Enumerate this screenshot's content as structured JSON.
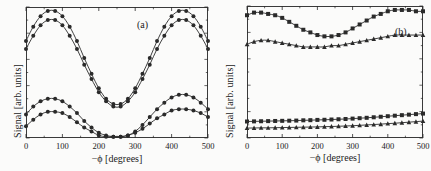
{
  "figure": {
    "background": "#fbfbfa",
    "ink": "#2a2a2a"
  },
  "panels": [
    {
      "tag": "(a)",
      "xlabel": "−ϕ [degrees]",
      "ylabel": "Signal [arb. units]",
      "xticks": [
        "0",
        "100",
        "200",
        "300",
        "400",
        "500"
      ]
    },
    {
      "tag": "(b)",
      "xlabel": "−ϕ [degrees]",
      "ylabel": "Signal [arb. units]",
      "xticks": [
        "0",
        "100",
        "200",
        "300",
        "400",
        "500"
      ]
    }
  ],
  "chart_data": [
    {
      "type": "line",
      "title": "(a)",
      "xlabel": "−ϕ [degrees]",
      "ylabel": "Signal [arb. units]",
      "xlim": [
        0,
        500
      ],
      "ylim": [
        0,
        1
      ],
      "xticks": [
        0,
        100,
        200,
        300,
        400,
        500
      ],
      "yticks": [],
      "grid": false,
      "legend": "none",
      "x": [
        0,
        20,
        40,
        60,
        80,
        100,
        120,
        140,
        160,
        180,
        200,
        220,
        240,
        260,
        280,
        300,
        320,
        340,
        360,
        380,
        400,
        420,
        440,
        460,
        480,
        500
      ],
      "series": [
        {
          "name": "upper-curve-1",
          "marker": "circle",
          "values": [
            0.74,
            0.85,
            0.93,
            0.97,
            0.97,
            0.93,
            0.85,
            0.74,
            0.61,
            0.49,
            0.38,
            0.3,
            0.26,
            0.26,
            0.3,
            0.38,
            0.49,
            0.61,
            0.74,
            0.85,
            0.93,
            0.97,
            0.97,
            0.93,
            0.85,
            0.74
          ]
        },
        {
          "name": "upper-curve-2",
          "marker": "circle",
          "values": [
            0.68,
            0.78,
            0.86,
            0.9,
            0.9,
            0.86,
            0.78,
            0.68,
            0.56,
            0.45,
            0.35,
            0.28,
            0.24,
            0.24,
            0.28,
            0.35,
            0.45,
            0.56,
            0.68,
            0.78,
            0.86,
            0.9,
            0.9,
            0.86,
            0.78,
            0.68
          ]
        },
        {
          "name": "lower-curve-1",
          "marker": "circle",
          "values": [
            0.18,
            0.24,
            0.28,
            0.3,
            0.3,
            0.28,
            0.24,
            0.19,
            0.13,
            0.08,
            0.04,
            0.02,
            0.01,
            0.01,
            0.02,
            0.05,
            0.1,
            0.16,
            0.22,
            0.27,
            0.31,
            0.33,
            0.33,
            0.31,
            0.27,
            0.22
          ]
        },
        {
          "name": "lower-curve-2",
          "marker": "circle",
          "values": [
            0.09,
            0.14,
            0.18,
            0.2,
            0.2,
            0.19,
            0.16,
            0.12,
            0.08,
            0.05,
            0.02,
            0.01,
            0.01,
            0.01,
            0.02,
            0.04,
            0.07,
            0.11,
            0.15,
            0.18,
            0.21,
            0.22,
            0.22,
            0.21,
            0.19,
            0.16
          ]
        }
      ]
    },
    {
      "type": "line",
      "title": "(b)",
      "xlabel": "−ϕ [degrees]",
      "ylabel": "Signal [arb. units]",
      "xlim": [
        0,
        500
      ],
      "ylim": [
        0,
        1
      ],
      "xticks": [
        0,
        100,
        200,
        300,
        400,
        500
      ],
      "yticks": [],
      "grid": false,
      "legend": "none",
      "x": [
        0,
        20,
        40,
        60,
        80,
        100,
        120,
        140,
        160,
        180,
        200,
        220,
        240,
        260,
        280,
        300,
        320,
        340,
        360,
        380,
        400,
        420,
        440,
        460,
        480,
        500
      ],
      "series": [
        {
          "name": "top-curve-squares",
          "marker": "square",
          "values": [
            0.93,
            0.95,
            0.95,
            0.94,
            0.93,
            0.91,
            0.88,
            0.85,
            0.82,
            0.8,
            0.78,
            0.77,
            0.77,
            0.78,
            0.8,
            0.83,
            0.86,
            0.89,
            0.92,
            0.94,
            0.96,
            0.97,
            0.97,
            0.97,
            0.96,
            0.96
          ]
        },
        {
          "name": "second-curve-triangles",
          "marker": "triangle",
          "values": [
            0.71,
            0.73,
            0.74,
            0.74,
            0.73,
            0.72,
            0.71,
            0.7,
            0.69,
            0.69,
            0.69,
            0.69,
            0.7,
            0.7,
            0.71,
            0.72,
            0.73,
            0.74,
            0.75,
            0.76,
            0.77,
            0.78,
            0.78,
            0.78,
            0.78,
            0.78
          ]
        },
        {
          "name": "bottom-curve-squares",
          "marker": "square",
          "values": [
            0.125,
            0.126,
            0.127,
            0.128,
            0.129,
            0.13,
            0.131,
            0.132,
            0.134,
            0.135,
            0.137,
            0.138,
            0.14,
            0.142,
            0.144,
            0.147,
            0.15,
            0.153,
            0.157,
            0.161,
            0.165,
            0.169,
            0.173,
            0.177,
            0.181,
            0.185
          ]
        },
        {
          "name": "bottom-curve-triangles",
          "marker": "triangle",
          "values": [
            0.075,
            0.076,
            0.077,
            0.077,
            0.078,
            0.079,
            0.08,
            0.081,
            0.082,
            0.083,
            0.084,
            0.086,
            0.087,
            0.089,
            0.091,
            0.093,
            0.096,
            0.099,
            0.102,
            0.105,
            0.109,
            0.112,
            0.116,
            0.12,
            0.124,
            0.128
          ]
        }
      ]
    }
  ]
}
